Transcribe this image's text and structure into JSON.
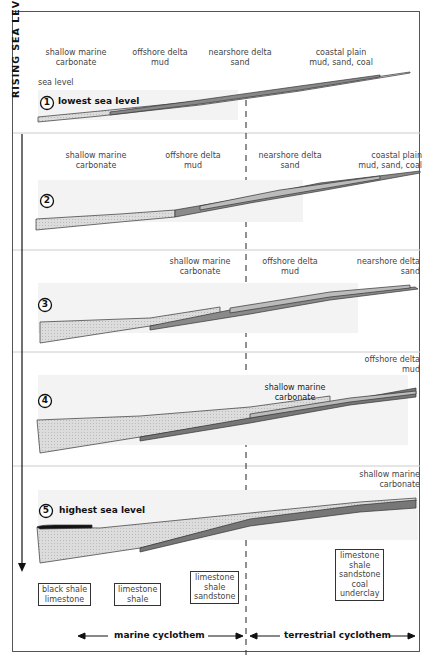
{
  "axis": {
    "label": "RISING SEA LEVEL"
  },
  "panels": [
    {
      "number": "1",
      "caption": "lowest sea level",
      "sea_level_label": "sea level",
      "facies": [
        {
          "line1": "shallow marine",
          "line2": "carbonate"
        },
        {
          "line1": "offshore delta",
          "line2": "mud"
        },
        {
          "line1": "nearshore delta",
          "line2": "sand"
        },
        {
          "line1": "coastal plain",
          "line2": "mud, sand, coal"
        }
      ]
    },
    {
      "number": "2",
      "facies": [
        {
          "line1": "shallow marine",
          "line2": "carbonate"
        },
        {
          "line1": "offshore delta",
          "line2": "mud"
        },
        {
          "line1": "nearshore delta",
          "line2": "sand"
        },
        {
          "line1": "coastal plain",
          "line2": "mud, sand, coal"
        }
      ]
    },
    {
      "number": "3",
      "facies": [
        {
          "line1": "shallow marine",
          "line2": "carbonate"
        },
        {
          "line1": "offshore delta",
          "line2": "mud"
        },
        {
          "line1": "nearshore delta",
          "line2": "sand"
        }
      ]
    },
    {
      "number": "4",
      "facies": [
        {
          "line1": "shallow marine",
          "line2": "carbonate"
        },
        {
          "line1": "offshore delta",
          "line2": "mud"
        }
      ]
    },
    {
      "number": "5",
      "caption": "highest sea level",
      "facies": [
        {
          "line1": "shallow marine",
          "line2": "carbonate"
        }
      ]
    }
  ],
  "sequences": [
    {
      "lines": [
        "black shale",
        "limestone"
      ]
    },
    {
      "lines": [
        "limestone",
        "shale"
      ]
    },
    {
      "lines": [
        "limestone",
        "shale",
        "sandstone"
      ]
    },
    {
      "lines": [
        "limestone",
        "shale",
        "sandstone",
        "coal",
        "underclay"
      ]
    }
  ],
  "cyclothems": {
    "marine": "marine cyclothem",
    "terrestrial": "terrestrial cyclothem"
  },
  "colors": {
    "frame": "#555555",
    "carbonate_fill": "#d8d8d8",
    "mud_fill": "#8a8a8a",
    "sand_fill": "#b5b5b5",
    "sea_band": "#f3f3f3",
    "black_shale": "#111111"
  }
}
